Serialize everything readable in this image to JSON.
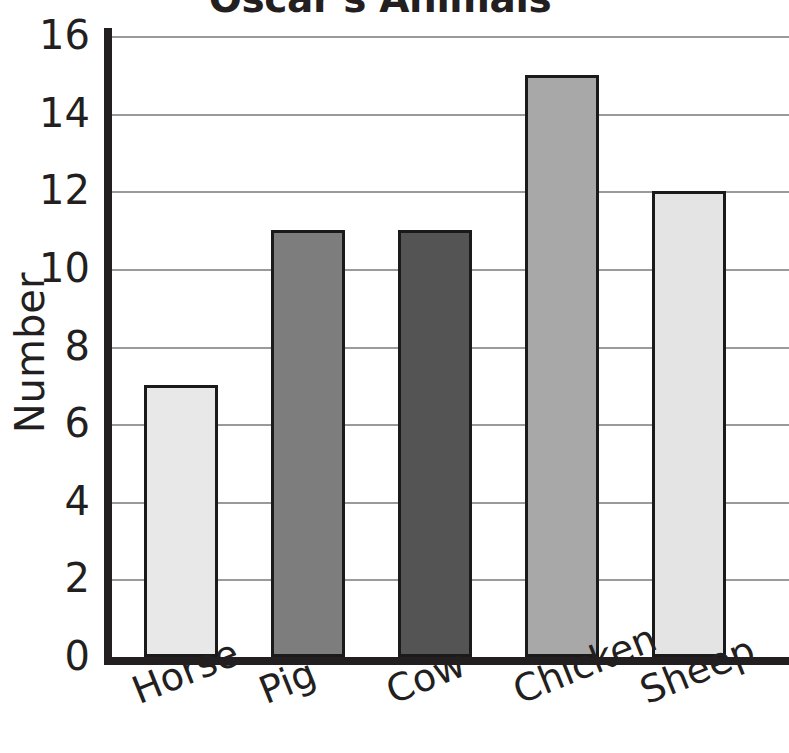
{
  "chart_data": {
    "type": "bar",
    "title": "Oscar's Animals",
    "xlabel": "",
    "ylabel": "Number",
    "categories": [
      "Horse",
      "Pig",
      "Cow",
      "Chicken",
      "Sheep"
    ],
    "values": [
      7,
      11,
      11,
      15,
      12
    ],
    "ylim": [
      0,
      16
    ],
    "ytick_labels": [
      "0",
      "2",
      "4",
      "6",
      "8",
      "10",
      "12",
      "14",
      "16"
    ],
    "ytick_values": [
      0,
      2,
      4,
      6,
      8,
      10,
      12,
      14,
      16
    ],
    "grid": true,
    "grid_axis": "y",
    "legend": false,
    "legend_position": "none",
    "bar_colors": [
      "#e8e8e8",
      "#7d7d7d",
      "#545454",
      "#a8a8a8",
      "#e4e4e4"
    ],
    "bar_edge_color": "#1a1a1a",
    "axis_color": "#231f20",
    "grid_color": "#9a9a9a",
    "background_color": "#ffffff",
    "xtick_label_rotation": -22
  },
  "axes": {
    "y_axis_title": "Number"
  }
}
